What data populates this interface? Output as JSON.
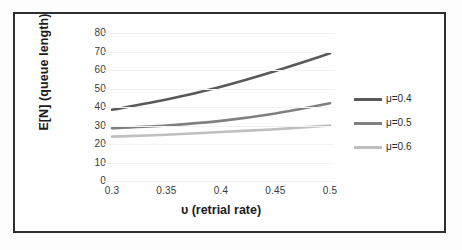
{
  "figure": {
    "border_color": "#2f2f2f",
    "background": "#ffffff"
  },
  "chart_data": {
    "type": "line",
    "title": "",
    "subtitle": "",
    "xlabel": "υ (retrial rate)",
    "ylabel": "E[N] (queue length)",
    "x": [
      0.3,
      0.35,
      0.4,
      0.45,
      0.5
    ],
    "x_tick_labels": [
      "0.3",
      "0.35",
      "0.4",
      "0.45",
      "0.5"
    ],
    "y_tick_labels": [
      "0",
      "10",
      "20",
      "30",
      "40",
      "50",
      "60",
      "70",
      "80"
    ],
    "y_ticks": [
      0,
      10,
      20,
      30,
      40,
      50,
      60,
      70,
      80
    ],
    "xlim": [
      0.3,
      0.5
    ],
    "ylim": [
      0,
      80
    ],
    "grid": "horizontal-faint",
    "legend_position": "right",
    "series": [
      {
        "name": "μ=0.4",
        "color": "#595959",
        "values": [
          38.5,
          44.0,
          51.0,
          59.5,
          69.0
        ]
      },
      {
        "name": "μ=0.5",
        "color": "#808080",
        "values": [
          28.5,
          30.0,
          32.5,
          36.5,
          42.0
        ]
      },
      {
        "name": "μ=0.6",
        "color": "#bfbfbf",
        "values": [
          24.0,
          25.0,
          26.5,
          28.0,
          30.0
        ]
      }
    ]
  }
}
